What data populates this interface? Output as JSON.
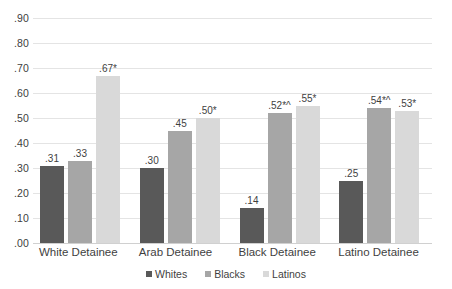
{
  "chart_data": {
    "type": "bar",
    "title": "",
    "subtitle": "",
    "xlabel": "",
    "ylabel": "",
    "ylim": [
      0.0,
      0.9
    ],
    "grid": true,
    "legend_position": "bottom",
    "categories": [
      "White Detainee",
      "Arab Detainee",
      "Black Detainee",
      "Latino Detainee"
    ],
    "y_ticks": [
      ".90",
      ".80",
      ".70",
      ".60",
      ".50",
      ".40",
      ".30",
      ".20",
      ".10",
      ".00"
    ],
    "y_tick_values": [
      0.9,
      0.8,
      0.7,
      0.6,
      0.5,
      0.4,
      0.3,
      0.2,
      0.1,
      0.0
    ],
    "series": [
      {
        "name": "Whites",
        "color": "#595959",
        "values": [
          0.31,
          0.3,
          0.14,
          0.25
        ],
        "labels": [
          ".31",
          ".30",
          ".14",
          ".25"
        ]
      },
      {
        "name": "Blacks",
        "color": "#a6a6a6",
        "values": [
          0.33,
          0.45,
          0.52,
          0.54
        ],
        "labels": [
          ".33",
          ".45",
          ".52*^",
          ".54*^"
        ]
      },
      {
        "name": "Latinos",
        "color": "#d9d9d9",
        "values": [
          0.67,
          0.5,
          0.55,
          0.53
        ],
        "labels": [
          ".67*",
          ".50*",
          ".55*",
          ".53*"
        ]
      }
    ],
    "annotations": {
      "significance_markers": [
        "*",
        "^"
      ]
    }
  },
  "legend": {
    "items": [
      {
        "label": "Whites",
        "color": "#595959"
      },
      {
        "label": "Blacks",
        "color": "#a6a6a6"
      },
      {
        "label": "Latinos",
        "color": "#d9d9d9"
      }
    ]
  }
}
